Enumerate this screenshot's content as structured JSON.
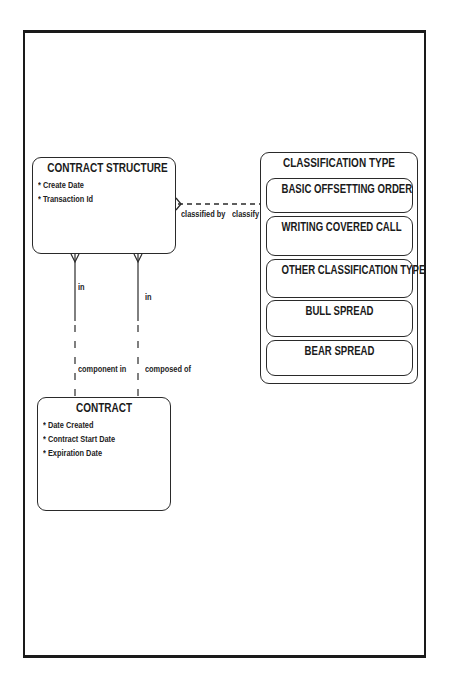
{
  "diagram": {
    "type": "entity-relationship",
    "entities": [
      {
        "name": "CONTRACT STRUCTURE",
        "attributes": [
          "* Create Date",
          "* Transaction Id"
        ]
      },
      {
        "name": "CONTRACT",
        "attributes": [
          "* Date Created",
          "* Contract Start Date",
          "* Expiration Date"
        ]
      },
      {
        "name": "CLASSIFICATION TYPE",
        "subtypes": [
          "BASIC OFFSETTING ORDER",
          "WRITING COVERED CALL",
          "OTHER CLASSIFICATION TYPE",
          "BULL SPREAD",
          "BEAR SPREAD"
        ]
      }
    ],
    "relationships": [
      {
        "from": "CONTRACT STRUCTURE",
        "to": "CLASSIFICATION TYPE",
        "from_label": "classified by",
        "to_label": "classify"
      },
      {
        "from": "CONTRACT STRUCTURE",
        "to": "CONTRACT",
        "from_label": "in",
        "to_label": "component in"
      },
      {
        "from": "CONTRACT STRUCTURE",
        "to": "CONTRACT",
        "from_label": "in",
        "to_label": "composed of"
      }
    ]
  },
  "labels": {
    "classified_by": "classified by",
    "classify": "classify",
    "in_left": "in",
    "in_right": "in",
    "component_in": "component in",
    "composed_of": "composed of"
  },
  "colors": {
    "line": "#2a2a2a",
    "background": "#ffffff"
  }
}
